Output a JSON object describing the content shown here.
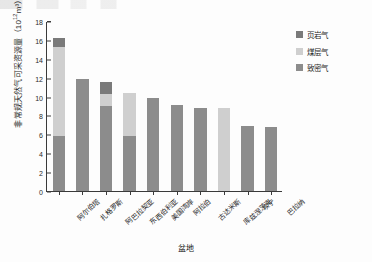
{
  "chart_data": {
    "type": "bar",
    "stacked": true,
    "title": "",
    "xlabel": "盆地",
    "ylabel": "非常规天然气可采资源量（10¹²m³）",
    "ylabel_main": "非常规天然气可采资源量（10",
    "ylabel_exp": "12",
    "ylabel_tail": "m³）",
    "ylim": [
      0,
      18
    ],
    "ytick_step": 2,
    "yticks": [
      "0",
      "2",
      "4",
      "6",
      "8",
      "10",
      "12",
      "14",
      "16",
      "18"
    ],
    "grid": false,
    "legend_position": "top-right",
    "categories": [
      "阿尔伯塔",
      "扎格罗斯",
      "阿巴拉契亚",
      "东西伯利亚",
      "美国湾岸",
      "阿拉伯",
      "古达米斯",
      "库兹涅茨克",
      "坎宁",
      "巴拉纳"
    ],
    "series": [
      {
        "name": "致密气",
        "color": "#8c8c8c",
        "values": [
          5.8,
          11.9,
          9.0,
          5.8,
          9.9,
          9.1,
          8.8,
          0.0,
          6.9,
          6.8
        ]
      },
      {
        "name": "煤层气",
        "color": "#cfcfcf",
        "values": [
          9.5,
          0.0,
          1.3,
          4.6,
          0.0,
          0.0,
          0.0,
          8.8,
          0.0,
          0.0
        ]
      },
      {
        "name": "页岩气",
        "color": "#7a7a7a",
        "values": [
          0.9,
          0.0,
          1.2,
          0.0,
          0.0,
          0.0,
          0.0,
          0.0,
          0.0,
          0.0
        ]
      }
    ],
    "totals": [
      16.2,
      11.9,
      11.5,
      10.4,
      9.9,
      9.1,
      8.8,
      8.8,
      6.9,
      6.8
    ]
  },
  "legend": {
    "items": [
      {
        "label": "页岩气",
        "color": "#7a7a7a"
      },
      {
        "label": "煤层气",
        "color": "#cfcfcf"
      },
      {
        "label": "致密气",
        "color": "#8c8c8c"
      }
    ]
  }
}
